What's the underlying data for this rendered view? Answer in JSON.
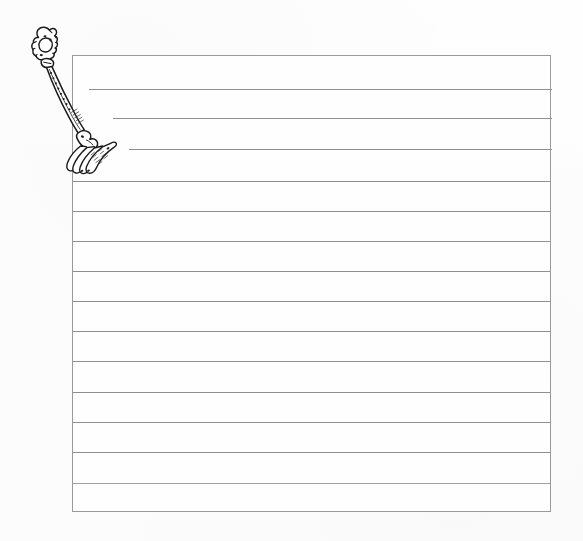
{
  "document": {
    "title": "Ruled writing sheet with fork illustration",
    "background_color": "#fdfdfd",
    "width": 583,
    "height": 541
  },
  "sheet": {
    "name": "ruled-sheet",
    "border_color": "#9a9a9a",
    "paper_color": "#fefefe",
    "left": 72,
    "top": 55,
    "width": 479,
    "height": 457,
    "rule_color": "#8f8f8f",
    "rule_spacing": 30,
    "rule_count": 14,
    "lines": [
      {
        "index": 1,
        "y": 33,
        "x_start": 16,
        "x_end": 479,
        "indented": true,
        "note": "shortened to clear fork handle"
      },
      {
        "index": 2,
        "y": 62,
        "x_start": 40,
        "x_end": 479,
        "indented": true,
        "note": "shortened to clear fork neck"
      },
      {
        "index": 3,
        "y": 93,
        "x_start": 56,
        "x_end": 479,
        "indented": true,
        "note": "shortened to clear fork tines"
      },
      {
        "index": 4,
        "y": 125,
        "x_start": 0,
        "x_end": 479,
        "indented": false,
        "note": ""
      },
      {
        "index": 5,
        "y": 155,
        "x_start": 0,
        "x_end": 479,
        "indented": false,
        "note": ""
      },
      {
        "index": 6,
        "y": 185,
        "x_start": 0,
        "x_end": 479,
        "indented": false,
        "note": ""
      },
      {
        "index": 7,
        "y": 215,
        "x_start": 0,
        "x_end": 479,
        "indented": false,
        "note": ""
      },
      {
        "index": 8,
        "y": 245,
        "x_start": 0,
        "x_end": 479,
        "indented": false,
        "note": ""
      },
      {
        "index": 9,
        "y": 275,
        "x_start": 0,
        "x_end": 479,
        "indented": false,
        "note": ""
      },
      {
        "index": 10,
        "y": 305,
        "x_start": 0,
        "x_end": 479,
        "indented": false,
        "note": ""
      },
      {
        "index": 11,
        "y": 336,
        "x_start": 0,
        "x_end": 479,
        "indented": false,
        "note": ""
      },
      {
        "index": 12,
        "y": 366,
        "x_start": 0,
        "x_end": 479,
        "indented": false,
        "note": ""
      },
      {
        "index": 13,
        "y": 396,
        "x_start": 0,
        "x_end": 479,
        "indented": false,
        "note": ""
      },
      {
        "index": 14,
        "y": 427,
        "x_start": 0,
        "x_end": 479,
        "indented": false,
        "note": ""
      }
    ],
    "written_text": ""
  },
  "illustration": {
    "name": "fork-drawing",
    "subject": "fork",
    "style": "black ink line drawing",
    "description": "Ornate antique table fork drawn diagonally from upper-left to lower-right, decorative scrolled handle terminal at top, beaded shaft, four curved fanned tines at bottom",
    "ink_color": "#1a1a1a",
    "parts": [
      {
        "name": "handle-terminal",
        "label": "scrolled finial"
      },
      {
        "name": "handle-shaft",
        "label": "beaded shaft"
      },
      {
        "name": "fork-neck",
        "label": "neck"
      },
      {
        "name": "fork-tines",
        "label": "four tines"
      }
    ],
    "orientation": "diagonal, handle upper-left, tines lower-right"
  }
}
